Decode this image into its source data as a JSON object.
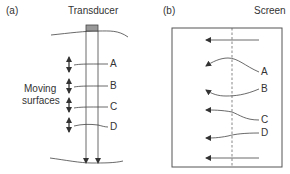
{
  "panel_a": {
    "label": "(a)",
    "title": "Transducer",
    "side_label_line1": "Moving",
    "side_label_line2": "surfaces",
    "surfaces": [
      "A",
      "B",
      "C",
      "D"
    ]
  },
  "panel_b": {
    "label": "(b)",
    "title": "Screen",
    "echoes": [
      "A",
      "B",
      "C",
      "D"
    ]
  },
  "colors": {
    "line": "#444444",
    "transducer_fill": "#999999",
    "dashed": "#555555"
  }
}
